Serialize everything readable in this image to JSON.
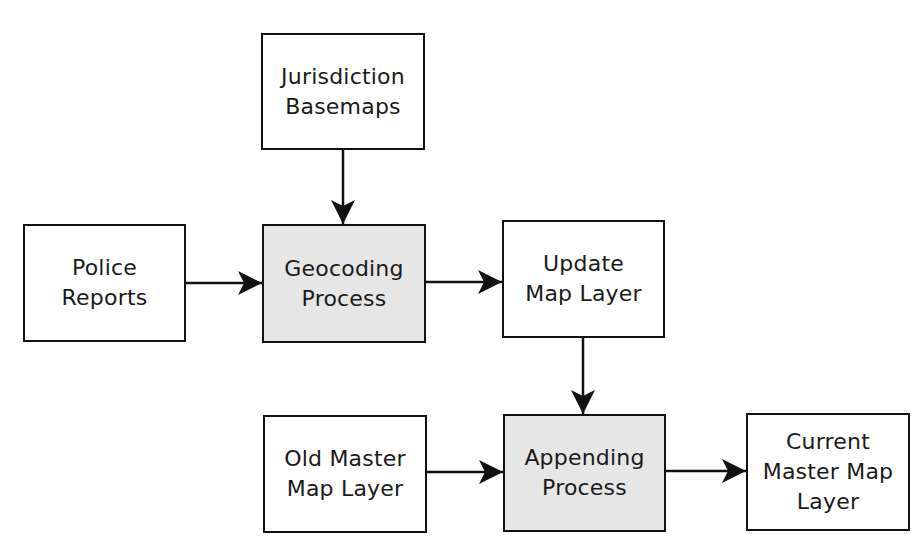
{
  "diagram": {
    "type": "flowchart",
    "colors": {
      "stroke": "#111111",
      "box_fill": "#ffffff",
      "process_fill": "#e6e6e6",
      "text": "#1a1a1a"
    },
    "nodes": {
      "jurisdiction_basemaps": {
        "label": "Jurisdiction\nBasemaps",
        "kind": "data"
      },
      "police_reports": {
        "label": "Police\nReports",
        "kind": "data"
      },
      "geocoding_process": {
        "label": "Geocoding\nProcess",
        "kind": "process"
      },
      "update_map_layer": {
        "label": "Update\nMap Layer",
        "kind": "data"
      },
      "old_master_map_layer": {
        "label": "Old Master\nMap Layer",
        "kind": "data"
      },
      "appending_process": {
        "label": "Appending\nProcess",
        "kind": "process"
      },
      "current_master_map_layer": {
        "label": "Current\nMaster Map\nLayer",
        "kind": "data"
      }
    },
    "edges": [
      {
        "from": "jurisdiction_basemaps",
        "to": "geocoding_process"
      },
      {
        "from": "police_reports",
        "to": "geocoding_process"
      },
      {
        "from": "geocoding_process",
        "to": "update_map_layer"
      },
      {
        "from": "update_map_layer",
        "to": "appending_process"
      },
      {
        "from": "old_master_map_layer",
        "to": "appending_process"
      },
      {
        "from": "appending_process",
        "to": "current_master_map_layer"
      }
    ]
  }
}
